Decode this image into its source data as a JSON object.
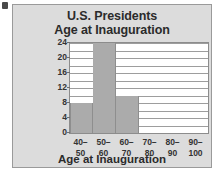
{
  "chart_data": {
    "type": "bar",
    "title": "U.S. Presidents",
    "subtitle": "Age at Inauguration",
    "title_line1": "U.S. Presidents",
    "title_line2": "Age at Inauguration",
    "xlabel": "Age at Inauguration",
    "ylabel": "Frequency",
    "categories": [
      "40–50",
      "50–60",
      "60–70",
      "70–80",
      "80–90",
      "90–100"
    ],
    "category_lines": [
      [
        "40–",
        "50"
      ],
      [
        "50–",
        "60"
      ],
      [
        "60–",
        "70"
      ],
      [
        "70–",
        "80"
      ],
      [
        "80–",
        "90"
      ],
      [
        "90–",
        "100"
      ]
    ],
    "values": [
      8,
      24,
      10,
      0,
      0,
      0
    ],
    "ylim": [
      0,
      24
    ],
    "yticks": [
      0,
      4,
      8,
      12,
      16,
      20,
      24
    ],
    "ytick_labels": [
      "0",
      "4",
      "8",
      "12",
      "16",
      "20",
      "24"
    ],
    "gridline_interval": 2,
    "grid": true,
    "legend": false,
    "bar_color": "#ababab",
    "plot_background": "#ffffff",
    "panel_background": "#dcdcdc",
    "text_color": "#2b2b2b"
  }
}
